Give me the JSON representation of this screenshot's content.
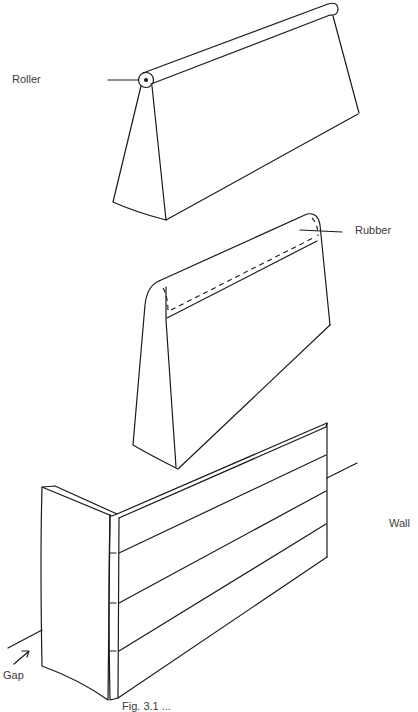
{
  "figure": {
    "labels": {
      "roller": "Roller",
      "rubber": "Rubber",
      "wall": "Wall",
      "gap": "Gap"
    },
    "caption": "Fig. 3.1 ..."
  },
  "colors": {
    "line": "#1a1a1a",
    "text": "#3a3a3a",
    "background": "#ffffff"
  }
}
